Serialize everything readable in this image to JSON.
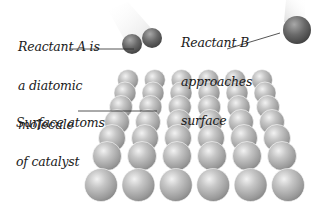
{
  "labels": {
    "reactant_a": [
      "Reactant A is",
      "a diatomic",
      "molecule"
    ],
    "reactant_b": [
      "Reactant B",
      "approaches",
      "surface"
    ],
    "catalyst": [
      "Surface atoms",
      "of catalyst"
    ]
  },
  "surface_grid": {
    "rows": 7,
    "columns": 6,
    "row_specs": [
      {
        "y": 80,
        "x0": 128,
        "x1": 262,
        "r": 10.5
      },
      {
        "y": 93,
        "x0": 125,
        "x1": 265,
        "r": 11
      },
      {
        "y": 107,
        "x0": 121,
        "x1": 268,
        "r": 11.5
      },
      {
        "y": 122,
        "x0": 117,
        "x1": 272,
        "r": 12.5
      },
      {
        "y": 138,
        "x0": 112,
        "x1": 277,
        "r": 13.5
      },
      {
        "y": 156,
        "x0": 107,
        "x1": 282,
        "r": 14.5
      },
      {
        "y": 185,
        "x0": 101,
        "x1": 288,
        "r": 16.5
      }
    ]
  },
  "colors": {
    "sphere_light": "#e2e2e2",
    "sphere_mid": "#a8a8a8",
    "sphere_dark": "#7a7a7a",
    "molecule_light": "#b8b8b8",
    "molecule_dark": "#4a4a4a",
    "leader_line": "#2a2a2a",
    "text": "#1a1a1a"
  }
}
